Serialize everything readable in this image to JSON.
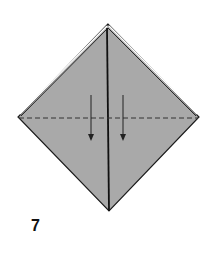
{
  "diagram": {
    "type": "origami-step",
    "step_number": "7",
    "colors": {
      "paper_fill": "#a9a9a9",
      "outline": "#1a1a1a",
      "background": "#ffffff"
    },
    "shape": {
      "kind": "diamond",
      "top": [
        108,
        24
      ],
      "left": [
        18,
        117
      ],
      "right": [
        199,
        117
      ],
      "bottom": [
        109,
        211
      ]
    },
    "lines": {
      "center_crease": "solid vertical line from top to bottom point",
      "valley_fold": "dashed horizontal line across the middle",
      "top_edges": "double-layer edges on upper left and upper right"
    },
    "arrows": [
      {
        "direction": "down",
        "x": 91,
        "from_y": 95,
        "to_y": 140
      },
      {
        "direction": "down",
        "x": 123,
        "from_y": 95,
        "to_y": 140
      }
    ]
  }
}
